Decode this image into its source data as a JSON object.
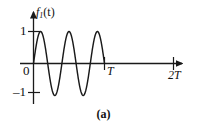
{
  "figure": {
    "caption": "(a)",
    "axis_color": "#1a1a1a",
    "curve_color": "#1a1a1a",
    "background": "#ffffff"
  },
  "labels": {
    "y_axis_function": "f",
    "y_axis_subscript": "1",
    "y_axis_argument": "(t)",
    "y_tick_positive": "1",
    "y_tick_negative": "–1",
    "origin": "0",
    "x_tick_t": "T",
    "x_tick_2t": "2T"
  },
  "chart_data": {
    "type": "line",
    "title": "",
    "subtitle": "",
    "xlabel": "",
    "ylabel": "f₁(t)",
    "xlim": [
      -0.08,
      2.25
    ],
    "ylim": [
      -1.35,
      1.35
    ],
    "grid": false,
    "legend": null,
    "x_tick_values": [
      0,
      1,
      2
    ],
    "x_tick_labels": [
      "0",
      "T",
      "2T"
    ],
    "y_tick_values": [
      -1,
      1
    ],
    "y_tick_labels": [
      "–1",
      "1"
    ],
    "annotations": [
      {
        "text": "f₁(t)",
        "x": 0.05,
        "y": 1.3
      },
      {
        "text": "(a)",
        "x": 1.05,
        "y": -1.7
      }
    ],
    "series": [
      {
        "name": "f1(t)",
        "description": "Sinusoid of unit amplitude, 2.5 cycles over interval 0 to T, zero elsewhere",
        "amplitude": 1,
        "cycles_in_T": 2.5,
        "domain": [
          0,
          1
        ],
        "x": [
          0,
          0.05,
          0.1,
          0.15,
          0.2,
          0.25,
          0.3,
          0.35,
          0.4,
          0.45,
          0.5,
          0.55,
          0.6,
          0.65,
          0.7,
          0.75,
          0.8,
          0.85,
          0.9,
          0.95,
          1.0,
          1.2,
          1.5,
          1.8,
          2.1,
          2.2
        ],
        "values": [
          0,
          0.707,
          1.0,
          0.707,
          0,
          -0.707,
          -1.0,
          -0.707,
          0,
          0.707,
          1.0,
          0.707,
          0,
          -0.707,
          -1.0,
          -0.707,
          0,
          0.707,
          1.0,
          0.707,
          0,
          0,
          0,
          0,
          0,
          0
        ]
      }
    ]
  }
}
